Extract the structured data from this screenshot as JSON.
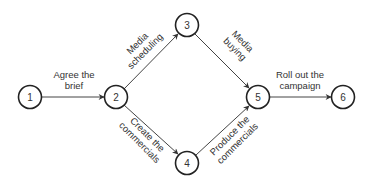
{
  "diagram": {
    "type": "activity-network",
    "nodes": [
      {
        "id": "1",
        "label": "1",
        "x": 30,
        "y": 97
      },
      {
        "id": "2",
        "label": "2",
        "x": 116,
        "y": 97
      },
      {
        "id": "3",
        "label": "3",
        "x": 187,
        "y": 25
      },
      {
        "id": "4",
        "label": "4",
        "x": 187,
        "y": 163
      },
      {
        "id": "5",
        "label": "5",
        "x": 258,
        "y": 97
      },
      {
        "id": "6",
        "label": "6",
        "x": 343,
        "y": 97
      }
    ],
    "edges": [
      {
        "from": "1",
        "to": "2",
        "label_lines": [
          "Agree the",
          "brief"
        ]
      },
      {
        "from": "2",
        "to": "3",
        "label_lines": [
          "Media",
          "scheduling"
        ]
      },
      {
        "from": "2",
        "to": "4",
        "label_lines": [
          "Create the",
          "commercials"
        ]
      },
      {
        "from": "3",
        "to": "5",
        "label_lines": [
          "Media",
          "buying"
        ]
      },
      {
        "from": "4",
        "to": "5",
        "label_lines": [
          "Produce the",
          "commercials"
        ]
      },
      {
        "from": "5",
        "to": "6",
        "label_lines": [
          "Roll out the",
          "campaign"
        ]
      }
    ]
  },
  "labels": {
    "n1": "1",
    "n2": "2",
    "n3": "3",
    "n4": "4",
    "n5": "5",
    "n6": "6",
    "e12_l1": "Agree the",
    "e12_l2": "brief",
    "e23_l1": "Media",
    "e23_l2": "scheduling",
    "e24_l1": "Create the",
    "e24_l2": "commercials",
    "e35_l1": "Media",
    "e35_l2": "buying",
    "e45_l1": "Produce the",
    "e45_l2": "commercials",
    "e56_l1": "Roll out the",
    "e56_l2": "campaign"
  },
  "colors": {
    "stroke": "#222222",
    "text": "#333333",
    "background": "#ffffff"
  }
}
